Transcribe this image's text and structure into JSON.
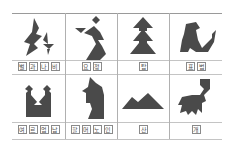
{
  "colors": {
    "shape": "#4a4a4a",
    "rule": "#9a9a9a",
    "label_border": "#8a8a8a"
  },
  "puzzles": [
    {
      "label": [
        "벌",
        "과",
        "나",
        "비"
      ],
      "subject": "bee-and-butterfly"
    },
    {
      "label": [
        "요",
        "정"
      ],
      "subject": "fairy"
    },
    {
      "label": [
        "탑"
      ],
      "subject": "tower"
    },
    {
      "label": [
        "표",
        "범"
      ],
      "subject": "leopard"
    },
    {
      "label": [
        "여",
        "르",
        "엄",
        "남"
      ],
      "subject": "castle"
    },
    {
      "label": [
        "할",
        "머",
        "노",
        "인"
      ],
      "subject": "old-person"
    },
    {
      "label": [
        "산"
      ],
      "subject": "mountain"
    },
    {
      "label": [
        "개"
      ],
      "subject": "dog"
    }
  ]
}
